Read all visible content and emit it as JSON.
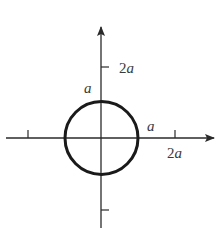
{
  "diagram": {
    "type": "circle-on-axes",
    "colors": {
      "axis": "#2a2a2a",
      "circle": "#1a1a1a",
      "label": "#3a3a3a"
    },
    "labels": {
      "y_tick_upper_coef": "2",
      "y_tick_upper_var": "a",
      "circle_top": "a",
      "circle_right": "a",
      "x_tick_right_coef": "2",
      "x_tick_right_var": "a"
    }
  }
}
